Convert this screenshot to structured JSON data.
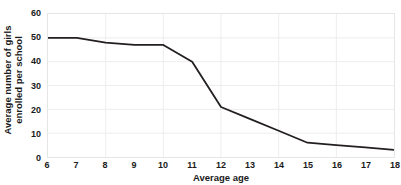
{
  "chart_data": {
    "type": "line",
    "title": "",
    "xlabel": "Average age",
    "ylabel": "Average number of girls enrolled per school",
    "ylabel_line1": "Average number of girls",
    "ylabel_line2": "enrolled per school",
    "x": [
      6,
      7,
      8,
      9,
      10,
      11,
      12,
      13,
      14,
      15,
      16,
      17,
      18
    ],
    "values": [
      50,
      50,
      48,
      47,
      47,
      40,
      21,
      16,
      11,
      6,
      5,
      4,
      3
    ],
    "series": [
      {
        "name": "Average number of girls enrolled per school",
        "values": [
          50,
          50,
          48,
          47,
          47,
          40,
          21,
          16,
          11,
          6,
          5,
          4,
          3
        ]
      }
    ],
    "xlim": [
      6,
      18
    ],
    "ylim": [
      0,
      60
    ],
    "xticks": [
      6,
      7,
      8,
      9,
      10,
      11,
      12,
      13,
      14,
      15,
      16,
      17,
      18
    ],
    "yticks": [
      0,
      10,
      20,
      30,
      40,
      50,
      60
    ],
    "xtick_labels": [
      "6",
      "7",
      "8",
      "9",
      "10",
      "11",
      "12",
      "13",
      "14",
      "15",
      "16",
      "17",
      "18"
    ],
    "ytick_labels": [
      "0",
      "10",
      "20",
      "30",
      "40",
      "50",
      "60"
    ],
    "grid": true,
    "grid_color": "#ededed",
    "legend": false,
    "legend_position": "none",
    "line_color": "#231f20",
    "line_width": 1.8,
    "background_color": "#ffffff",
    "border_color": "#e6e6e6",
    "text_color": "#1a1a1a",
    "annotations": []
  }
}
